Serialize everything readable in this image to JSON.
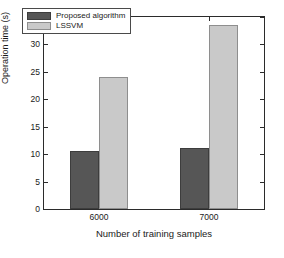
{
  "chart_data": {
    "type": "bar",
    "title": "",
    "xlabel": "Number of training samples",
    "ylabel": "Operation time (s)",
    "categories": [
      "6000",
      "7000"
    ],
    "series": [
      {
        "name": "Proposed algorithm",
        "color": "#565656",
        "values": [
          10.6,
          11.2
        ]
      },
      {
        "name": "LSSVM",
        "color": "#c9c9c9",
        "values": [
          24.1,
          33.6
        ]
      }
    ],
    "ylim": [
      0,
      35
    ],
    "yticks": [
      0,
      5,
      10,
      15,
      20,
      25,
      30,
      35
    ],
    "ytick_labels": [
      "0",
      "5",
      "10",
      "15",
      "20",
      "25",
      "30",
      "35"
    ],
    "xtick_labels": [
      "6000",
      "7000"
    ],
    "grid": false,
    "legend_position": "upper left",
    "frame": true
  }
}
